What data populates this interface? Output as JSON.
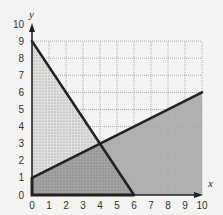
{
  "chart_data": {
    "type": "area",
    "title": "",
    "xlabel": "x",
    "ylabel": "y",
    "xlim": [
      0,
      10
    ],
    "ylim": [
      0,
      10
    ],
    "grid": true,
    "x_ticks": [
      "0",
      "1",
      "2",
      "3",
      "4",
      "5",
      "6",
      "7",
      "8",
      "9",
      "10"
    ],
    "y_ticks": [
      "0",
      "1",
      "2",
      "3",
      "4",
      "5",
      "6",
      "7",
      "8",
      "9",
      "10"
    ],
    "lines": [
      {
        "name": "line-1",
        "points": [
          [
            0,
            9
          ],
          [
            6,
            0
          ]
        ],
        "equation": "3x + 2y = 18"
      },
      {
        "name": "line-2",
        "points": [
          [
            0,
            1
          ],
          [
            10,
            6
          ]
        ],
        "equation": "y = x/2 + 1"
      }
    ],
    "intersection": [
      4,
      3
    ],
    "regions": [
      {
        "name": "stippled-triangle",
        "fill": "light-stipple",
        "vertices": [
          [
            0,
            1
          ],
          [
            0,
            9
          ],
          [
            4,
            3
          ]
        ]
      },
      {
        "name": "overlap-region",
        "fill": "dark-gray-stipple",
        "vertices": [
          [
            0,
            0
          ],
          [
            0,
            1
          ],
          [
            4,
            3
          ],
          [
            6,
            0
          ]
        ]
      },
      {
        "name": "gray-region",
        "fill": "medium-gray",
        "vertices": [
          [
            4,
            3
          ],
          [
            10,
            6
          ],
          [
            10,
            0
          ],
          [
            6,
            0
          ]
        ]
      }
    ]
  },
  "colors": {
    "background": "#f4f4f2",
    "grid": "#9a9a9a",
    "line": "#222222",
    "gray_region": "#a9a9a9",
    "overlap_region": "#9c9c9c",
    "stipple_bg": "#e2e2e0"
  }
}
